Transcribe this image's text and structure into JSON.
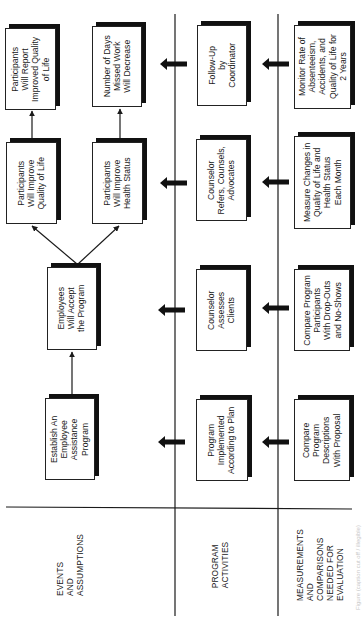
{
  "diagram": {
    "orientation": "rotated-90-ccw",
    "rows": {
      "events_and_assumptions": {
        "header": [
          "EVENTS",
          "AND",
          "ASSUMPTIONS"
        ],
        "boxes": {
          "establish": [
            "Establish An",
            "Employee",
            "Assistance",
            "Program"
          ],
          "accept": [
            "Employees",
            "Will Accept",
            "the Program"
          ],
          "improve_qol": [
            "Participants",
            "Will Improve",
            "Quality of Life"
          ],
          "improve_health": [
            "Participants",
            "Will Improve",
            "Health Status"
          ],
          "report_qol": [
            "Participants",
            "Will Report",
            "Improved Quality",
            "of Life"
          ],
          "days_missed": [
            "Number of Days",
            "Missed Work",
            "Will Decrease"
          ]
        }
      },
      "program_activities": {
        "header": [
          "PROGRAM",
          "ACTIVITIES"
        ],
        "boxes": {
          "implemented": [
            "Program",
            "Implemented",
            "According to Plan"
          ],
          "assesses": [
            "Counselor",
            "Assesses",
            "Clients"
          ],
          "refers": [
            "Counselor",
            "Refers, Counsels,",
            "Advocates"
          ],
          "followup": [
            "Follow-Up",
            "by",
            "Coordinator"
          ]
        }
      },
      "measurements": {
        "header": [
          "MEASUREMENTS",
          "AND",
          "COMPARISONS",
          "NEEDED FOR",
          "EVALUATION"
        ],
        "boxes": {
          "compare_descriptions": [
            "Compare",
            "Program",
            "Descriptions",
            "With Proposal"
          ],
          "compare_participants": [
            "Compare Program",
            "Participants",
            "With Drop-Outs",
            "and No-Shows"
          ],
          "measure_changes": [
            "Measure Changes in",
            "Quality of Life and",
            "Health Status",
            "Each Month"
          ],
          "monitor": [
            "Monitor Rate of",
            "Absenteeism,",
            "Accidents, and",
            "Quality of Life for",
            "2 Years"
          ]
        }
      }
    },
    "caption": "Figure (caption cut off / illegible)",
    "colors": {
      "line": "#1a1a1a",
      "shadow": "#111111",
      "box_fill": "#ffffff",
      "caption": "#c8c8c8"
    }
  }
}
